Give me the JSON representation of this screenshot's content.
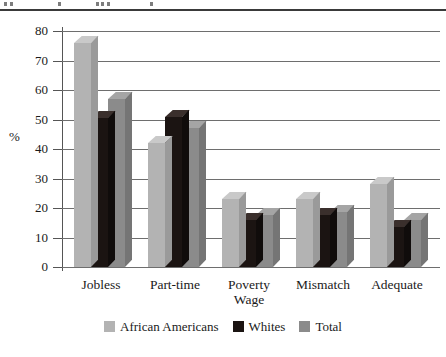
{
  "figure": {
    "background": "#ffffff",
    "top_crop_artifact": true
  },
  "chart_data": {
    "type": "bar",
    "title": "",
    "subtitle": "",
    "xlabel": "",
    "ylabel": "%",
    "ylim": [
      0,
      80
    ],
    "yticks": [
      0,
      10,
      20,
      30,
      40,
      50,
      60,
      70,
      80
    ],
    "ytick_labels": [
      "0",
      "10",
      "20",
      "30",
      "40",
      "50",
      "60",
      "70",
      "80"
    ],
    "grid": true,
    "grid_axis": "y",
    "legend_position": "bottom-center",
    "categories": [
      "Jobless",
      "Part-time",
      "Poverty Wage",
      "Mismatch",
      "Adequate"
    ],
    "category_label_lines": [
      [
        "Jobless"
      ],
      [
        "Part-time"
      ],
      [
        "Poverty",
        "Wage"
      ],
      [
        "Mismatch"
      ],
      [
        "Adequate"
      ]
    ],
    "series": [
      {
        "name": "African Americans",
        "color": "#b3b3b3",
        "top_color": "#c9c9c9",
        "side_color": "#9a9a9a",
        "values": [
          76,
          42,
          23,
          23,
          28
        ]
      },
      {
        "name": "Whites",
        "color": "#1b1412",
        "top_color": "#3a2f2c",
        "side_color": "#100c0b",
        "values": [
          50.5,
          51,
          16,
          17.5,
          13.5
        ]
      },
      {
        "name": "Total",
        "color": "#8b8b8b",
        "top_color": "#a5a5a5",
        "side_color": "#757575",
        "values": [
          57,
          47,
          17.5,
          18.5,
          16
        ]
      }
    ]
  },
  "axis": {
    "y_title": "%"
  },
  "legend": {
    "entries": [
      {
        "label": "African Americans",
        "color": "#b3b3b3"
      },
      {
        "label": "Whites",
        "color": "#1b1412"
      },
      {
        "label": "Total",
        "color": "#8b8b8b"
      }
    ]
  },
  "colors": {
    "gridline": "#6e6e6e",
    "axis_line": "#555555",
    "text": "#1a1a1a",
    "background": "#ffffff"
  }
}
